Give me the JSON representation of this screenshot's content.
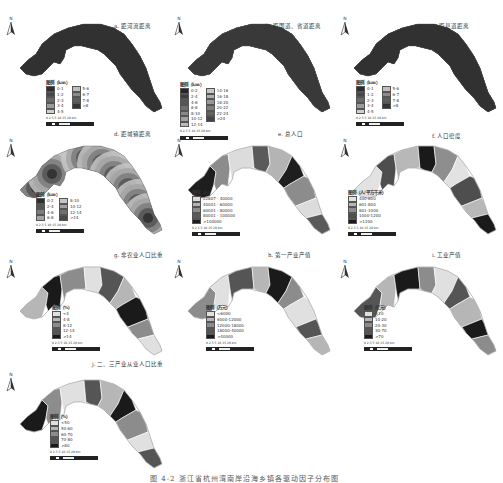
{
  "figure": {
    "caption": "图 4-2  浙江省杭州湾南岸沿海乡镇各驱动因子分布图",
    "scale_bar_label": "0 2.5 5    10    15    20  km",
    "north_label": "N"
  },
  "panels": [
    {
      "id": "a",
      "title": "a. 距河流距离",
      "legend_title": "图例（km）",
      "legend_cols": 2,
      "legend": [
        {
          "label": "0-1",
          "color": "#2e2e2e"
        },
        {
          "label": "1-2",
          "color": "#474747"
        },
        {
          "label": "2-3",
          "color": "#6a6a6a"
        },
        {
          "label": "3-4",
          "color": "#9a9a9a"
        },
        {
          "label": "4-5",
          "color": "#cfcfcf"
        },
        {
          "label": "5-6",
          "color": "#bdbdbd"
        },
        {
          "label": "6-7",
          "color": "#8a8a8a"
        },
        {
          "label": "7-8",
          "color": "#5e5e5e"
        },
        {
          "label": ">8",
          "color": "#333333"
        }
      ]
    },
    {
      "id": "b",
      "title": "b. 距国道、省道距离",
      "legend_title": "图例（km）",
      "legend_cols": 2,
      "legend": [
        {
          "label": "0-2",
          "color": "#262626"
        },
        {
          "label": "2-4",
          "color": "#3d3d3d"
        },
        {
          "label": "4-6",
          "color": "#565656"
        },
        {
          "label": "6-8",
          "color": "#6f6f6f"
        },
        {
          "label": "8-10",
          "color": "#888888"
        },
        {
          "label": "10-12",
          "color": "#a1a1a1"
        },
        {
          "label": "12-14",
          "color": "#bababa"
        },
        {
          "label": "14-16",
          "color": "#c8c8c8"
        },
        {
          "label": "16-18",
          "color": "#b0b0b0"
        },
        {
          "label": "18-20",
          "color": "#989898"
        },
        {
          "label": "20-22",
          "color": "#7e7e7e"
        },
        {
          "label": "22-24",
          "color": "#626262"
        },
        {
          "label": ">24",
          "color": "#444444"
        }
      ]
    },
    {
      "id": "c",
      "title": "c. 距县道距离",
      "legend_title": "图例（km）",
      "legend_cols": 2,
      "legend": [
        {
          "label": "0-1",
          "color": "#2e2e2e"
        },
        {
          "label": "1-2",
          "color": "#474747"
        },
        {
          "label": "2-3",
          "color": "#6a6a6a"
        },
        {
          "label": "3-4",
          "color": "#9a9a9a"
        },
        {
          "label": "4-5",
          "color": "#cfcfcf"
        },
        {
          "label": "5-6",
          "color": "#bdbdbd"
        },
        {
          "label": "6-7",
          "color": "#8a8a8a"
        },
        {
          "label": "7-8",
          "color": "#5e5e5e"
        },
        {
          "label": ">8",
          "color": "#333333"
        }
      ]
    },
    {
      "id": "d",
      "title": "d. 距城镇距离",
      "legend_title": "图例（km）",
      "legend_cols": 2,
      "legend": [
        {
          "label": "0-2",
          "color": "#2e2e2e"
        },
        {
          "label": "2-4",
          "color": "#555555"
        },
        {
          "label": "4-6",
          "color": "#7d7d7d"
        },
        {
          "label": "6-8",
          "color": "#a5a5a5"
        },
        {
          "label": "8-10",
          "color": "#c5c5c5"
        },
        {
          "label": "10-12",
          "color": "#a0a0a0"
        },
        {
          "label": "12-14",
          "color": "#707070"
        },
        {
          "label": ">14",
          "color": "#4a4a4a"
        }
      ]
    },
    {
      "id": "e",
      "title": "e. 总人口",
      "legend_title": "图例（人）",
      "legend_cols": 1,
      "legend": [
        {
          "label": "22807 - 40000",
          "color": "#dcdcdc"
        },
        {
          "label": "40001 - 60000",
          "color": "#b4b4b4"
        },
        {
          "label": "60001 - 80000",
          "color": "#8c8c8c"
        },
        {
          "label": "80001 - 100000",
          "color": "#5a5a5a"
        },
        {
          "label": ">100000",
          "color": "#1e1e1e"
        }
      ]
    },
    {
      "id": "f",
      "title": "f. 人口密度",
      "legend_title": "图例（人/平方千米）",
      "legend_cols": 1,
      "legend": [
        {
          "label": "400-600",
          "color": "#e2e2e2"
        },
        {
          "label": "601-800",
          "color": "#b8b8b8"
        },
        {
          "label": "801-1000",
          "color": "#8e8e8e"
        },
        {
          "label": "1000-1200",
          "color": "#4e4e4e"
        },
        {
          "label": ">1200",
          "color": "#1a1a1a"
        }
      ]
    },
    {
      "id": "g",
      "title": "g. 非农业人口比重",
      "legend_title": "图例（%）",
      "legend_cols": 1,
      "legend": [
        {
          "label": "<4",
          "color": "#e0e0e0"
        },
        {
          "label": "4-8",
          "color": "#b6b6b6"
        },
        {
          "label": "8-12",
          "color": "#8c8c8c"
        },
        {
          "label": "12-14",
          "color": "#555555"
        },
        {
          "label": ">14",
          "color": "#1a1a1a"
        }
      ]
    },
    {
      "id": "h",
      "title": "h. 第一产业产值",
      "legend_title": "图例（万元）",
      "legend_cols": 1,
      "legend": [
        {
          "label": "<6000",
          "color": "#e0e0e0"
        },
        {
          "label": "6000-12000",
          "color": "#b6b6b6"
        },
        {
          "label": "12000-18000",
          "color": "#8c8c8c"
        },
        {
          "label": "18000-40000",
          "color": "#555555"
        },
        {
          "label": ">40000",
          "color": "#1a1a1a"
        }
      ]
    },
    {
      "id": "i",
      "title": "i. 工业产值",
      "legend_title": "图例（亿元）",
      "legend_cols": 1,
      "legend": [
        {
          "label": "<10",
          "color": "#e0e0e0"
        },
        {
          "label": "10-20",
          "color": "#b6b6b6"
        },
        {
          "label": "20-30",
          "color": "#8c8c8c"
        },
        {
          "label": "30-70",
          "color": "#555555"
        },
        {
          "label": ">70",
          "color": "#1a1a1a"
        }
      ]
    },
    {
      "id": "j",
      "title": "j. 二、三产业从业人口比重",
      "legend_title": "图例（%）",
      "legend_cols": 1,
      "legend": [
        {
          "label": "<50",
          "color": "#e0e0e0"
        },
        {
          "label": "50-60",
          "color": "#b6b6b6"
        },
        {
          "label": "60-70",
          "color": "#8c8c8c"
        },
        {
          "label": "70-80",
          "color": "#555555"
        },
        {
          "label": ">80",
          "color": "#1a1a1a"
        }
      ]
    }
  ]
}
